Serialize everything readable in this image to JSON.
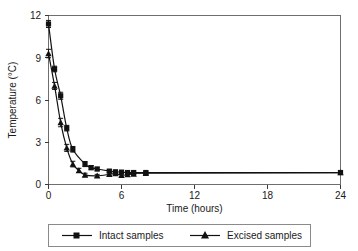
{
  "chart_data": {
    "type": "line",
    "title": "",
    "xlabel": "Time (hours)",
    "ylabel": "Temperature (°C)",
    "xlim": [
      0,
      24
    ],
    "ylim": [
      0,
      12
    ],
    "xticks": [
      0,
      6,
      12,
      18,
      24
    ],
    "yticks": [
      0,
      3,
      6,
      9,
      12
    ],
    "xtick_labels": [
      "0",
      "6",
      "12",
      "18",
      "24"
    ],
    "ytick_labels": [
      "0",
      "3",
      "6",
      "9",
      "12"
    ],
    "grid": false,
    "legend_position": "below-axes",
    "error_bars": true,
    "series": [
      {
        "name": "Intact samples",
        "marker": "square",
        "color": "#111111",
        "x": [
          0,
          0.5,
          1,
          1.5,
          2,
          3,
          3.5,
          4,
          5,
          5.5,
          6,
          6.5,
          7,
          8,
          24
        ],
        "y": [
          11.4,
          8.2,
          6.3,
          4.0,
          2.5,
          1.45,
          1.2,
          1.1,
          0.95,
          0.9,
          0.88,
          0.85,
          0.85,
          0.85,
          0.85
        ],
        "yerr": [
          0.25,
          0.2,
          0.25,
          0.2,
          0.2,
          0.18,
          0.15,
          0.12,
          0.1,
          0.1,
          0.1,
          0.1,
          0.1,
          0.1,
          0.05
        ]
      },
      {
        "name": "Excised samples",
        "marker": "triangle",
        "color": "#111111",
        "x": [
          0,
          0.5,
          1,
          1.5,
          2,
          2.5,
          3,
          4,
          5,
          5.5,
          6,
          6.5,
          7,
          8,
          24
        ],
        "y": [
          9.3,
          7.0,
          4.4,
          2.6,
          1.45,
          1.0,
          0.68,
          0.62,
          0.72,
          0.78,
          0.65,
          0.7,
          0.75,
          0.8,
          0.85
        ],
        "yerr": [
          0.3,
          0.25,
          0.3,
          0.25,
          0.2,
          0.15,
          0.12,
          0.1,
          0.1,
          0.1,
          0.1,
          0.1,
          0.1,
          0.1,
          0.05
        ]
      }
    ]
  },
  "axes": {
    "ylabel": "Temperature (°C)",
    "xlabel": "Time (hours)",
    "ytick_0": "0",
    "ytick_1": "3",
    "ytick_2": "6",
    "ytick_3": "9",
    "ytick_4": "12",
    "xtick_0": "0",
    "xtick_1": "6",
    "xtick_2": "12",
    "xtick_3": "18",
    "xtick_4": "24"
  },
  "legend": {
    "entries": [
      {
        "label": "Intact samples",
        "marker": "square"
      },
      {
        "label": "Excised samples",
        "marker": "triangle"
      }
    ],
    "entry_0_label": "Intact samples",
    "entry_1_label": "Excised samples"
  }
}
